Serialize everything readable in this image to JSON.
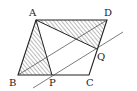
{
  "diagram": {
    "colors": {
      "stroke": "#222222",
      "hatch": "#555555",
      "background": "#ffffff"
    },
    "points": {
      "A": {
        "label": "A",
        "x": 36,
        "y": 20
      },
      "D": {
        "label": "D",
        "x": 107,
        "y": 20
      },
      "B": {
        "label": "B",
        "x": 18,
        "y": 75
      },
      "C": {
        "label": "C",
        "x": 89,
        "y": 75
      },
      "P": {
        "label": "P",
        "x": 52,
        "y": 75
      },
      "Q": {
        "label": "Q",
        "x": 97,
        "y": 49
      }
    },
    "labels": {
      "A": "A",
      "B": "B",
      "C": "C",
      "D": "D",
      "P": "P",
      "Q": "Q"
    },
    "shaded_regions": [
      "triangle ABP",
      "triangle AQD"
    ],
    "segments": [
      "AB",
      "BC",
      "CD",
      "DA",
      "AP",
      "AQ",
      "BD"
    ],
    "lines": [
      "line through P and Q parallel to BD"
    ]
  }
}
